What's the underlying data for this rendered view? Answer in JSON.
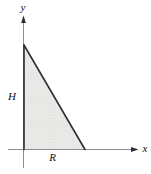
{
  "figure": {
    "axes": {
      "vertical_label": "y",
      "horizontal_label": "x"
    },
    "triangle": {
      "height_label": "H",
      "base_label": "R"
    },
    "colors": {
      "background": "#ffffff",
      "axis": "#8f8f8f",
      "triangle_stroke": "#2e2e2e",
      "triangle_fill": "#eaeae8",
      "triangle_dot": "#c9c9c5",
      "label": "#111111"
    }
  }
}
